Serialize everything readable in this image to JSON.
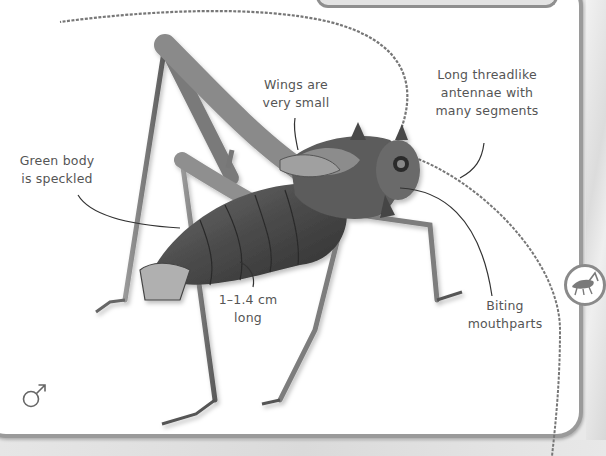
{
  "labels": {
    "wings": [
      "Wings are",
      "very small"
    ],
    "antennae": [
      "Long threadlike",
      "antennae with",
      "many segments"
    ],
    "body": [
      "Green body",
      "is speckled"
    ],
    "size": [
      "1–1.4 cm",
      "long"
    ],
    "mouthparts": [
      "Biting",
      "mouthparts"
    ]
  },
  "symbols": {
    "gender": "male-symbol",
    "badge": "cricket-silhouette-icon"
  },
  "colors": {
    "panel_bg": "#ffffff",
    "panel_border": "#9a9a9a",
    "label_text": "#555555",
    "background": "#e9e9e9",
    "insect_dark": "#3a3a3a",
    "insect_mid": "#8a8a8a"
  }
}
